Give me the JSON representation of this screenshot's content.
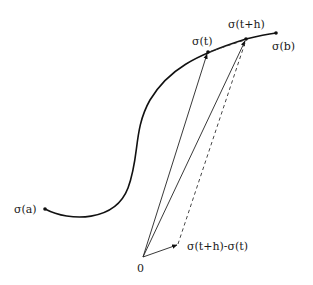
{
  "diagram": {
    "labels": {
      "sigma_a": "σ(a)",
      "sigma_t": "σ(t)",
      "sigma_t_plus_h": "σ(t+h)",
      "sigma_b": "σ(b)",
      "origin": "0",
      "difference": "σ(t+h)-σ(t)"
    },
    "points": {
      "origin": [
        143,
        257
      ],
      "sigma_a": [
        45,
        209
      ],
      "sigma_t": [
        208,
        52
      ],
      "sigma_t_plus_h": [
        246,
        39
      ],
      "sigma_b": [
        276,
        33
      ],
      "difference_tip": [
        178,
        244
      ]
    },
    "colors": {
      "curve": "#111111",
      "vectors": "#222222",
      "text": "#1a1a1a",
      "background": "#ffffff"
    }
  }
}
